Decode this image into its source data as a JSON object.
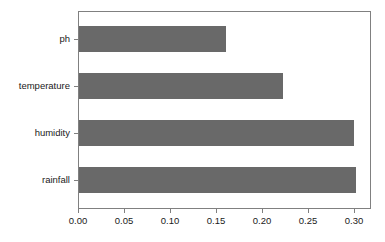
{
  "chart_data": {
    "type": "bar",
    "orientation": "horizontal",
    "title": "",
    "xlabel": "",
    "ylabel": "",
    "categories": [
      "rainfall",
      "humidity",
      "temperature",
      "ph"
    ],
    "values": [
      0.302,
      0.3,
      0.222,
      0.16
    ],
    "series": [
      {
        "name": "importance",
        "values": [
          0.302,
          0.3,
          0.222,
          0.16
        ]
      }
    ],
    "xlim": [
      0.0,
      0.3183
    ],
    "xticks": [
      0.0,
      0.05,
      0.1,
      0.15,
      0.2,
      0.25,
      0.3
    ],
    "xticklabels": [
      "0.00",
      "0.05",
      "0.10",
      "0.15",
      "0.20",
      "0.25",
      "0.30"
    ],
    "yticklabels": [
      "ph",
      "temperature",
      "humidity",
      "rainfall"
    ],
    "grid": false,
    "legend": null,
    "bar_color": "#696969",
    "frame_color": "#808080",
    "background_color": "#ffffff",
    "text_color": "#1a1a1a"
  }
}
